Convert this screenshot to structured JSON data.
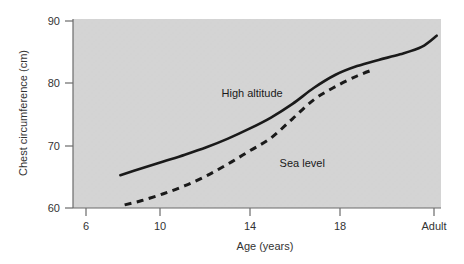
{
  "chart_data": {
    "type": "line",
    "title": "",
    "xlabel": "Age (years)",
    "ylabel": "Chest circumference (cm)",
    "xticklabels": [
      "6",
      "10",
      "14",
      "18",
      "Adult"
    ],
    "xtickvalues": [
      6,
      10,
      14,
      18,
      22
    ],
    "yticklabels": [
      "60",
      "70",
      "80",
      "90"
    ],
    "ytickvalues": [
      60,
      70,
      80,
      90
    ],
    "xlim": [
      5.3,
      22.4
    ],
    "ylim": [
      60,
      90.5
    ],
    "grid": false,
    "legend_position": "inline-annotations",
    "plot_background": "#d4d4d4",
    "series": [
      {
        "name": "High altitude",
        "style": "solid",
        "color": "#1a1a1a",
        "label_text": "High altitude",
        "x": [
          7.5,
          8.5,
          9.5,
          10.5,
          11.5,
          12.5,
          13.5,
          14.5,
          15.5,
          16.5,
          17.5,
          18.5,
          19.5,
          20.5,
          21.5,
          22.2
        ],
        "y": [
          65.3,
          66.4,
          67.5,
          68.6,
          69.8,
          71.2,
          72.8,
          74.6,
          76.8,
          79.4,
          81.5,
          82.9,
          83.9,
          84.8,
          86.0,
          87.8
        ]
      },
      {
        "name": "Sea level",
        "style": "dashed",
        "color": "#1a1a1a",
        "label_text": "Sea level",
        "x": [
          7.7,
          8.5,
          9.5,
          10.5,
          11.5,
          12.5,
          13.5,
          14.5,
          15.5,
          16.5,
          17.5,
          18.5,
          19.3
        ],
        "y": [
          60.5,
          61.2,
          62.3,
          63.6,
          65.2,
          67.1,
          69.2,
          71.3,
          74.4,
          77.5,
          79.6,
          81.3,
          82.4
        ]
      }
    ],
    "annotations": [
      {
        "text": "High altitude",
        "x": 12.2,
        "y": 78.0
      },
      {
        "text": "Sea level",
        "x": 14.9,
        "y": 66.6
      }
    ]
  }
}
